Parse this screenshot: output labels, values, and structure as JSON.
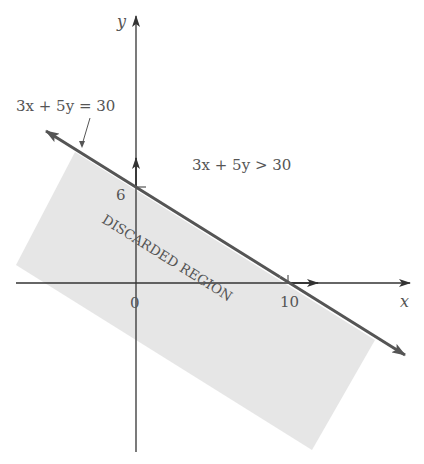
{
  "diagram": {
    "axes": {
      "x_label": "x",
      "y_label": "y"
    },
    "ticks": {
      "origin": "0",
      "y_intercept": "6",
      "x_intercept": "10"
    },
    "line": {
      "equation_label": "3x + 5y = 30",
      "color": "#555555"
    },
    "inequality_label": "3x + 5y > 30",
    "region_label": "DISCARDED REGION",
    "region_color": "#e6e6e6"
  }
}
